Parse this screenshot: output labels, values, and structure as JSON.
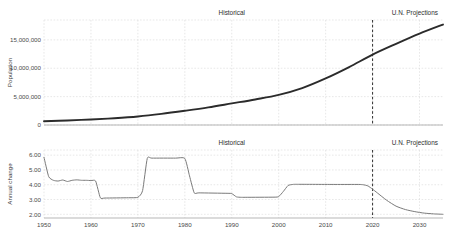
{
  "chart_data": [
    {
      "type": "line",
      "title": "",
      "xlabel": "",
      "ylabel": "Population",
      "xlim": [
        1950,
        2035
      ],
      "ylim": [
        0,
        18500000
      ],
      "grid": true,
      "legend_position": "none",
      "xticks": [
        1950,
        1960,
        1970,
        1980,
        1990,
        2000,
        2010,
        2020,
        2030
      ],
      "xticklabels": [
        "1950",
        "1960",
        "1970",
        "1980",
        "1990",
        "2000",
        "2010",
        "2020",
        "2030"
      ],
      "yticks": [
        0,
        5000000,
        10000000,
        15000000
      ],
      "yticklabels": [
        "0",
        "5,000,000",
        "10,000,000",
        "15,000,000"
      ],
      "annotations": [
        {
          "text": "Historical",
          "x": 1990
        },
        {
          "text": "U.N. Projections",
          "x": 2029
        }
      ],
      "divider": {
        "x": 2020,
        "style": "dashed"
      },
      "series": [
        {
          "name": "Population",
          "color": "#2b2b2b",
          "x": [
            1950,
            1955,
            1960,
            1965,
            1970,
            1975,
            1980,
            1985,
            1990,
            1995,
            2000,
            2005,
            2010,
            2015,
            2020,
            2025,
            2030,
            2035
          ],
          "values": [
            650000,
            800000,
            980000,
            1200000,
            1500000,
            1950000,
            2500000,
            3100000,
            3800000,
            4500000,
            5300000,
            6500000,
            8200000,
            10200000,
            12400000,
            14300000,
            16100000,
            17700000
          ]
        }
      ]
    },
    {
      "type": "line",
      "title": "",
      "xlabel": "",
      "ylabel": "Annual change",
      "xlim": [
        1950,
        2035
      ],
      "ylim": [
        1.75,
        6.35
      ],
      "grid": true,
      "legend_position": "none",
      "xticks": [
        1950,
        1960,
        1970,
        1980,
        1990,
        2000,
        2010,
        2020,
        2030
      ],
      "xticklabels": [
        "1950",
        "1960",
        "1970",
        "1980",
        "1990",
        "2000",
        "2010",
        "2020",
        "2030"
      ],
      "yticks": [
        2.0,
        3.0,
        4.0,
        5.0,
        6.0
      ],
      "yticklabels": [
        "2.00",
        "3.00",
        "4.00",
        "5.00",
        "6.00"
      ],
      "annotations": [
        {
          "text": "Historical",
          "x": 1990
        },
        {
          "text": "U.N. Projections",
          "x": 2029
        }
      ],
      "divider": {
        "x": 2020,
        "style": "dashed"
      },
      "series": [
        {
          "name": "Annual change",
          "color": "#7a7a7a",
          "x": [
            1950,
            1951,
            1952,
            1953,
            1954,
            1955,
            1956,
            1957,
            1958,
            1959,
            1960,
            1961,
            1962,
            1963,
            1968,
            1970,
            1971,
            1972,
            1973,
            1978,
            1980,
            1981,
            1982,
            1983,
            1989,
            1990,
            1991,
            1992,
            1993,
            1999,
            2000,
            2001,
            2002,
            2003,
            2004,
            2012,
            2017,
            2018,
            2019,
            2020,
            2021,
            2023,
            2025,
            2027,
            2029,
            2031,
            2033,
            2035
          ],
          "values": [
            5.85,
            4.55,
            4.3,
            4.25,
            4.32,
            4.22,
            4.3,
            4.33,
            4.3,
            4.3,
            4.28,
            4.25,
            3.12,
            3.1,
            3.12,
            3.15,
            3.6,
            5.78,
            5.8,
            5.8,
            5.78,
            4.6,
            3.45,
            3.45,
            3.42,
            3.4,
            3.18,
            3.15,
            3.15,
            3.16,
            3.2,
            3.55,
            3.95,
            4.02,
            4.03,
            4.02,
            4.02,
            4.0,
            3.92,
            3.7,
            3.45,
            2.95,
            2.55,
            2.32,
            2.18,
            2.08,
            2.03,
            2.0
          ]
        }
      ]
    }
  ]
}
